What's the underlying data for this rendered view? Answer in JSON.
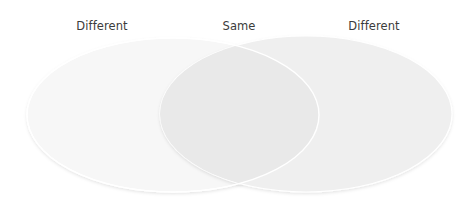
{
  "diagram": {
    "type": "venn",
    "labels": {
      "left": "Different",
      "center": "Same",
      "right": "Different"
    },
    "sets": [
      {
        "name": "left-set",
        "cx": 173,
        "cy": 115,
        "rx": 146,
        "ry": 77,
        "fill": "#f6f6f6"
      },
      {
        "name": "right-set",
        "cx": 306,
        "cy": 114,
        "rx": 146,
        "ry": 78,
        "fill": "#eeeeee"
      }
    ],
    "colors": {
      "text": "#3b3b3b",
      "outline": "#ffffff",
      "background": "#ffffff"
    }
  }
}
